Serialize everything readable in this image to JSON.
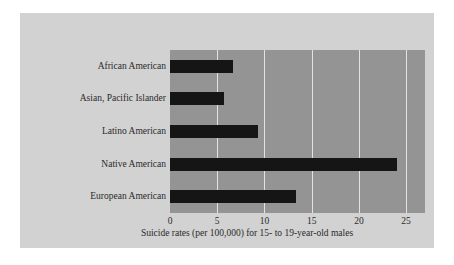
{
  "figure": {
    "background_color": "#ffffff",
    "panel_color": "#d2d2d2",
    "plot_area_color": "#949494",
    "bar_color": "#151515",
    "gridline_color": "#e2e2e2"
  },
  "chart_data": {
    "type": "bar",
    "orientation": "horizontal",
    "title": "",
    "subtitle": "",
    "xlabel": "Suicide rates (per 100,000) for 15- to 19-year-old males",
    "ylabel": "",
    "categories": [
      "African American",
      "Asian, Pacific Islander",
      "Latino American",
      "Native American",
      "European American"
    ],
    "values": [
      6.7,
      5.7,
      9.3,
      24.0,
      13.3
    ],
    "xlim": [
      0,
      27
    ],
    "xticks": [
      0,
      5,
      10,
      15,
      20,
      25
    ],
    "xtick_labels": [
      "0",
      "5",
      "10",
      "15",
      "20",
      "25"
    ],
    "grid": true,
    "grid_axis": "x",
    "legend": false,
    "legend_position": "none"
  }
}
